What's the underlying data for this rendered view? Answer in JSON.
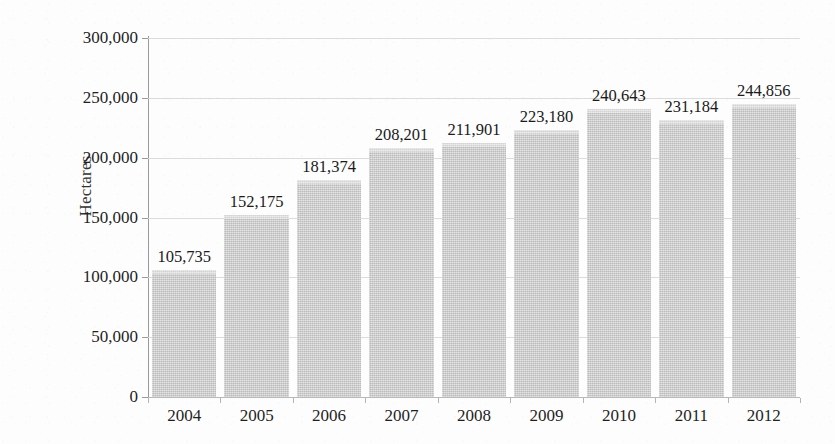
{
  "chart_data": {
    "type": "bar",
    "title": "",
    "subtitle": "",
    "xlabel": "",
    "ylabel": "Hectares",
    "categories": [
      "2004",
      "2005",
      "2006",
      "2007",
      "2008",
      "2009",
      "2010",
      "2011",
      "2012"
    ],
    "values": [
      105735,
      152175,
      181374,
      208201,
      211901,
      223180,
      240643,
      231184,
      244856
    ],
    "value_labels": [
      "105,735",
      "152,175",
      "181,374",
      "208,201",
      "211,901",
      "223,180",
      "240,643",
      "231,184",
      "244,856"
    ],
    "ylim": [
      0,
      300000
    ],
    "y_tick_values": [
      0,
      50000,
      100000,
      150000,
      200000,
      250000,
      300000
    ],
    "y_tick_labels": [
      "0",
      "50,000",
      "100,000",
      "150,000",
      "200,000",
      "250,000",
      "300,000"
    ],
    "grid": true,
    "grid_axis": "y",
    "legend": false,
    "legend_position": "none",
    "data_labels_shown": true,
    "bar_color": "#c9c9c9",
    "gridline_color": "#dcdcdc",
    "axis_color": "#9a9a9a",
    "text_color": "#1a1a1a",
    "background_color": "#fdfdfd"
  }
}
